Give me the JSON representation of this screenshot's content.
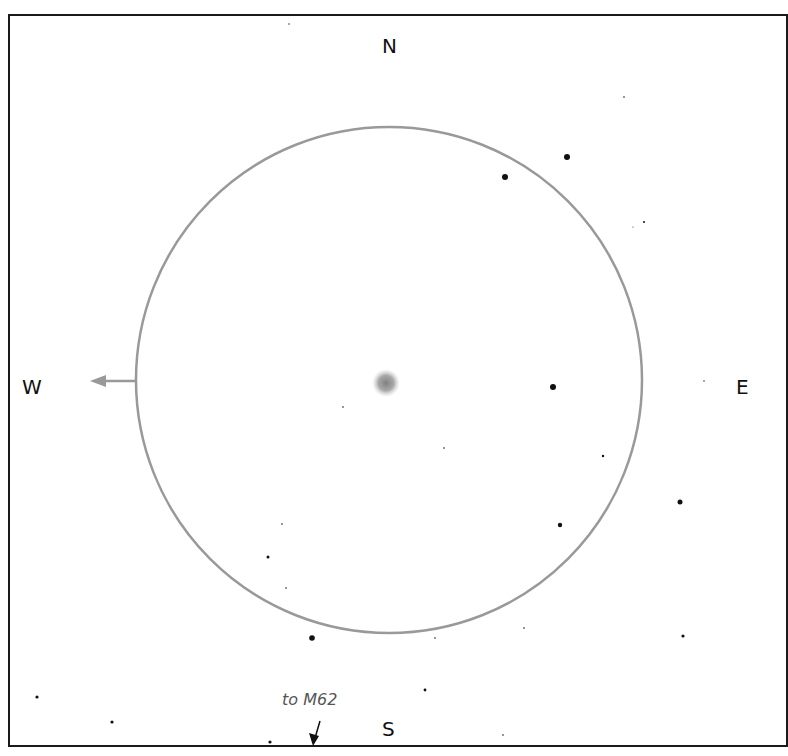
{
  "directions": {
    "north": "N",
    "south": "S",
    "east": "E",
    "west": "W"
  },
  "annotation": {
    "text": "to M62",
    "arrow": "down-arrow-icon"
  },
  "colors": {
    "circle": "#999999",
    "frame": "#1a1a1a",
    "star": "#111111",
    "nebula": "#888888",
    "arrow": "#999999"
  },
  "field_circle": {
    "cx": 389,
    "cy": 380,
    "r": 253
  },
  "nebula": {
    "cx": 386,
    "cy": 383,
    "r": 14
  },
  "stars": [
    {
      "x": 567,
      "y": 157,
      "r": 3
    },
    {
      "x": 505,
      "y": 177,
      "r": 3
    },
    {
      "x": 553,
      "y": 387,
      "r": 3
    },
    {
      "x": 680,
      "y": 502,
      "r": 2.5
    },
    {
      "x": 560,
      "y": 525,
      "r": 2.2
    },
    {
      "x": 312,
      "y": 638,
      "r": 2.8
    },
    {
      "x": 268,
      "y": 557,
      "r": 1.5
    },
    {
      "x": 683,
      "y": 636,
      "r": 1.6
    },
    {
      "x": 603,
      "y": 456,
      "r": 1.2
    },
    {
      "x": 425,
      "y": 690,
      "r": 1.4
    },
    {
      "x": 37,
      "y": 697,
      "r": 1.6
    },
    {
      "x": 112,
      "y": 722,
      "r": 1.6
    },
    {
      "x": 270,
      "y": 742,
      "r": 1.6
    },
    {
      "x": 644,
      "y": 222,
      "r": 1
    },
    {
      "x": 624,
      "y": 97,
      "r": 0.8
    },
    {
      "x": 343,
      "y": 407,
      "r": 0.8
    },
    {
      "x": 444,
      "y": 448,
      "r": 0.8
    },
    {
      "x": 282,
      "y": 524,
      "r": 0.8
    },
    {
      "x": 286,
      "y": 588,
      "r": 0.8
    },
    {
      "x": 435,
      "y": 638,
      "r": 0.8
    },
    {
      "x": 524,
      "y": 628,
      "r": 0.8
    },
    {
      "x": 503,
      "y": 735,
      "r": 0.8
    },
    {
      "x": 704,
      "y": 381,
      "r": 0.7
    },
    {
      "x": 289,
      "y": 24,
      "r": 0.7
    },
    {
      "x": 633,
      "y": 227,
      "r": 0.5
    }
  ]
}
